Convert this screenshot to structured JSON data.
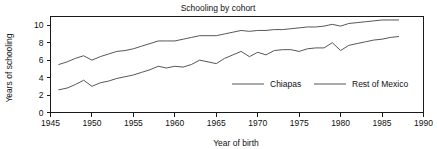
{
  "chart_data": {
    "type": "line",
    "title": "Schooling by cohort",
    "xlabel": "Year of birth",
    "ylabel": "Years of schooling",
    "xlim": [
      1945,
      1990
    ],
    "ylim": [
      0,
      11
    ],
    "xticks": [
      1945,
      1950,
      1955,
      1960,
      1965,
      1970,
      1975,
      1980,
      1985,
      1990
    ],
    "yticks": [
      0,
      2,
      4,
      6,
      8,
      10
    ],
    "grid": false,
    "legend_position": "inside-lower-right",
    "line_color": "#444444",
    "x": [
      1946,
      1947,
      1948,
      1949,
      1950,
      1951,
      1952,
      1953,
      1954,
      1955,
      1956,
      1957,
      1958,
      1959,
      1960,
      1961,
      1962,
      1963,
      1964,
      1965,
      1966,
      1967,
      1968,
      1969,
      1970,
      1971,
      1972,
      1973,
      1974,
      1975,
      1976,
      1977,
      1978,
      1979,
      1980,
      1981,
      1982,
      1983,
      1984,
      1985,
      1986,
      1987
    ],
    "series": [
      {
        "name": "Chiapas",
        "values": [
          2.6,
          2.8,
          3.2,
          3.7,
          3.0,
          3.4,
          3.6,
          3.9,
          4.1,
          4.3,
          4.6,
          4.9,
          5.3,
          5.1,
          5.3,
          5.2,
          5.5,
          6.0,
          5.8,
          5.6,
          6.2,
          6.6,
          7.0,
          6.4,
          6.9,
          6.6,
          7.1,
          7.2,
          7.2,
          7.0,
          7.3,
          7.4,
          7.4,
          8.0,
          7.1,
          7.7,
          7.9,
          8.1,
          8.3,
          8.4,
          8.6,
          8.7
        ]
      },
      {
        "name": "Rest of Mexico",
        "values": [
          5.5,
          5.8,
          6.2,
          6.5,
          6.0,
          6.4,
          6.7,
          7.0,
          7.1,
          7.3,
          7.6,
          7.9,
          8.2,
          8.2,
          8.2,
          8.4,
          8.6,
          8.8,
          8.8,
          8.8,
          9.0,
          9.2,
          9.4,
          9.3,
          9.4,
          9.4,
          9.5,
          9.5,
          9.6,
          9.7,
          9.8,
          9.8,
          9.9,
          10.1,
          9.9,
          10.2,
          10.3,
          10.4,
          10.5,
          10.6,
          10.6,
          10.6
        ]
      }
    ]
  },
  "labels": {
    "title": "Schooling by cohort",
    "x_axis_title": "Year of birth",
    "y_axis_title": "Years of schooling",
    "legend": [
      {
        "label": "Chiapas"
      },
      {
        "label": "Rest of Mexico"
      }
    ]
  }
}
